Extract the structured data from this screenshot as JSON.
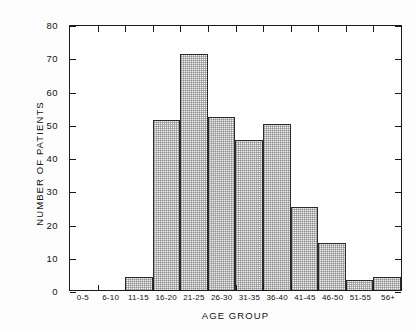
{
  "chart_data": {
    "type": "bar",
    "title": "",
    "xlabel": "AGE GROUP",
    "ylabel": "NUMBER OF PATIENTS",
    "categories": [
      "0-5",
      "6-10",
      "11-15",
      "16-20",
      "21-25",
      "26-30",
      "31-35",
      "36-40",
      "41-45",
      "46-50",
      "51-55",
      "56+"
    ],
    "values": [
      0,
      0,
      4,
      51,
      71,
      52,
      45,
      50,
      25,
      14,
      3,
      4
    ],
    "ylim": [
      0,
      80
    ],
    "yticks": [
      0,
      10,
      20,
      30,
      40,
      50,
      60,
      70,
      80
    ],
    "ytick_labels": [
      "0",
      "10",
      "20",
      "30",
      "40",
      "50",
      "60",
      "70",
      "80"
    ],
    "grid": false,
    "legend": null,
    "bar_fill": "#efefef",
    "bar_edge": "#2a2a2a",
    "axis_color": "#1a1a1a"
  }
}
